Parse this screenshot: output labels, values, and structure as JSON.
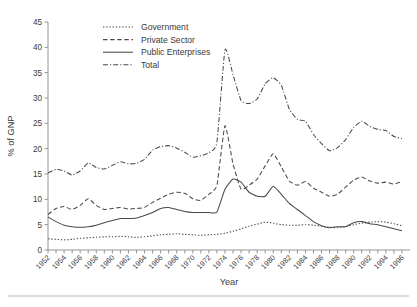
{
  "chart_data": {
    "type": "line",
    "title": "",
    "xlabel": "Year",
    "ylabel": "% of GNP",
    "xlim": [
      1952,
      1997
    ],
    "ylim": [
      0,
      45
    ],
    "yticks": [
      0,
      5,
      10,
      15,
      20,
      25,
      30,
      35,
      40,
      45
    ],
    "xticks": [
      1952,
      1954,
      1956,
      1958,
      1960,
      1962,
      1964,
      1966,
      1968,
      1970,
      1972,
      1974,
      1976,
      1978,
      1980,
      1982,
      1984,
      1986,
      1988,
      1990,
      1992,
      1994,
      1996
    ],
    "grid": false,
    "legend_position": "top-left",
    "x": [
      1952,
      1953,
      1954,
      1955,
      1956,
      1957,
      1958,
      1959,
      1960,
      1961,
      1962,
      1963,
      1964,
      1965,
      1966,
      1967,
      1968,
      1969,
      1970,
      1971,
      1972,
      1973,
      1974,
      1975,
      1976,
      1977,
      1978,
      1979,
      1980,
      1981,
      1982,
      1983,
      1984,
      1985,
      1986,
      1987,
      1988,
      1989,
      1990,
      1991,
      1992,
      1993,
      1994,
      1995,
      1996
    ],
    "series": [
      {
        "name": "Government",
        "style": "dotted",
        "values": [
          2.2,
          2.1,
          2.0,
          2.1,
          2.3,
          2.4,
          2.5,
          2.6,
          2.6,
          2.7,
          2.6,
          2.5,
          2.6,
          2.8,
          3.0,
          3.1,
          3.2,
          3.1,
          3.0,
          2.9,
          3.0,
          3.1,
          3.3,
          3.7,
          4.2,
          4.7,
          5.1,
          5.5,
          5.3,
          5.0,
          4.9,
          4.9,
          5.0,
          4.9,
          4.7,
          4.5,
          4.4,
          4.6,
          5.0,
          5.3,
          5.5,
          5.6,
          5.5,
          5.2,
          4.8
        ]
      },
      {
        "name": "Private Sector",
        "style": "dashed",
        "values": [
          7.0,
          8.2,
          8.6,
          8.0,
          8.8,
          10.1,
          8.8,
          8.0,
          8.2,
          8.4,
          8.1,
          8.2,
          8.4,
          9.4,
          10.2,
          11.0,
          11.4,
          11.2,
          10.1,
          9.8,
          11.0,
          12.8,
          24.5,
          17.0,
          12.0,
          12.8,
          14.0,
          16.6,
          19.0,
          16.4,
          13.6,
          12.8,
          13.5,
          12.2,
          11.4,
          10.6,
          11.0,
          12.4,
          13.8,
          14.4,
          13.6,
          13.2,
          13.4,
          13.0,
          13.5
        ]
      },
      {
        "name": "Public Enterprises",
        "style": "solid",
        "values": [
          6.5,
          5.6,
          4.9,
          4.6,
          4.5,
          4.6,
          4.9,
          5.4,
          5.8,
          6.2,
          6.2,
          6.3,
          6.8,
          7.4,
          8.2,
          8.4,
          8.0,
          7.6,
          7.4,
          7.4,
          7.4,
          7.5,
          12.0,
          14.0,
          13.4,
          11.4,
          10.6,
          10.6,
          12.6,
          11.0,
          9.2,
          8.0,
          6.8,
          5.6,
          4.8,
          4.4,
          4.6,
          4.6,
          5.4,
          5.6,
          5.2,
          5.0,
          4.6,
          4.2,
          3.8
        ]
      },
      {
        "name": "Total",
        "style": "dash-dot",
        "values": [
          15.2,
          15.9,
          15.6,
          14.8,
          15.6,
          17.2,
          16.3,
          16.0,
          16.7,
          17.4,
          17.0,
          17.1,
          17.9,
          19.7,
          20.4,
          20.6,
          20.1,
          19.3,
          18.3,
          18.6,
          19.2,
          21.3,
          39.5,
          34.6,
          29.5,
          28.9,
          29.8,
          32.8,
          34.0,
          32.5,
          27.8,
          25.8,
          25.4,
          22.8,
          21.0,
          19.6,
          20.2,
          21.8,
          24.2,
          25.4,
          24.4,
          23.8,
          23.6,
          22.4,
          22.0
        ]
      }
    ]
  },
  "legend": {
    "items": [
      {
        "label": "Government"
      },
      {
        "label": "Private Sector"
      },
      {
        "label": "Public Enterprises"
      },
      {
        "label": "Total"
      }
    ]
  }
}
